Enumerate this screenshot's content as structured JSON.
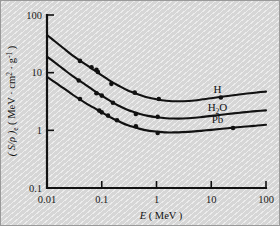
{
  "figure": {
    "background_color": "#d6d6d6",
    "ink_color": "#111111",
    "border_color": "#9a9a9a"
  },
  "axes": {
    "x": {
      "title_symbol": "E",
      "title_units": "( MeV )",
      "tick_labels": [
        "0.01",
        "0.1",
        "1",
        "10",
        "100"
      ],
      "tick_values": [
        0.01,
        0.1,
        1,
        10,
        100
      ],
      "scale": "log",
      "range": [
        0.01,
        100
      ]
    },
    "y": {
      "title_symbol": "( S/ρ )",
      "title_subscript": "e",
      "title_units_open": "( MeV · cm",
      "title_units_sup": "2",
      "title_units_mid": " · g",
      "title_units_sup2": "-1",
      "title_units_close": " )",
      "tick_labels": [
        "100",
        "10",
        "1",
        "0.1"
      ],
      "tick_values": [
        100,
        10,
        1,
        0.1
      ],
      "scale": "log",
      "range": [
        0.1,
        100
      ]
    }
  },
  "chart_data": {
    "type": "line",
    "title": "",
    "xlabel": "E ( MeV )",
    "ylabel": "( S/ρ )e ( MeV · cm2 · g-1 )",
    "xscale": "log",
    "yscale": "log",
    "xlim": [
      0.01,
      100
    ],
    "ylim": [
      0.1,
      100
    ],
    "grid": false,
    "legend": "inline-curve-labels",
    "series": [
      {
        "name": "H",
        "label": "H",
        "label_x": 13.0,
        "label_y": 4.4,
        "x": [
          0.01,
          0.015,
          0.02,
          0.03,
          0.05,
          0.07,
          0.1,
          0.15,
          0.2,
          0.3,
          0.5,
          0.7,
          1.0,
          1.5,
          2.0,
          3.0,
          5.0,
          7.0,
          10.0,
          20.0,
          30.0,
          50.0,
          70.0,
          100.0
        ],
        "y": [
          45.0,
          33.0,
          26.5,
          19.5,
          14.0,
          11.3,
          9.0,
          7.0,
          6.0,
          4.9,
          4.1,
          3.7,
          3.45,
          3.25,
          3.2,
          3.2,
          3.3,
          3.45,
          3.6,
          3.95,
          4.15,
          4.4,
          4.55,
          4.7
        ],
        "markers_x": [
          0.04,
          0.065,
          0.08,
          0.085,
          0.15,
          0.4,
          1.1,
          15.0
        ],
        "markers_y": [
          16.0,
          12.4,
          11.2,
          10.3,
          6.4,
          4.5,
          3.5,
          3.7
        ]
      },
      {
        "name": "H2O",
        "label": "H₂O",
        "label_x": 13.0,
        "label_y": 2.15,
        "x": [
          0.01,
          0.015,
          0.02,
          0.03,
          0.05,
          0.07,
          0.1,
          0.15,
          0.2,
          0.3,
          0.5,
          0.7,
          1.0,
          1.5,
          2.0,
          3.0,
          5.0,
          7.0,
          10.0,
          20.0,
          30.0,
          50.0,
          70.0,
          100.0
        ],
        "y": [
          19.0,
          14.2,
          11.5,
          8.6,
          6.2,
          5.0,
          4.0,
          3.15,
          2.7,
          2.25,
          1.92,
          1.78,
          1.69,
          1.62,
          1.6,
          1.6,
          1.65,
          1.71,
          1.78,
          1.92,
          2.0,
          2.1,
          2.16,
          2.22
        ]
      },
      {
        "name": "Pb",
        "label": "Pb",
        "label_x": 13.0,
        "label_y": 1.32,
        "x": [
          0.01,
          0.015,
          0.02,
          0.03,
          0.05,
          0.07,
          0.1,
          0.15,
          0.2,
          0.3,
          0.5,
          0.7,
          1.0,
          1.5,
          2.0,
          3.0,
          5.0,
          7.0,
          10.0,
          20.0,
          30.0,
          50.0,
          70.0,
          100.0
        ],
        "y": [
          8.5,
          6.5,
          5.4,
          4.1,
          3.0,
          2.5,
          2.05,
          1.65,
          1.45,
          1.22,
          1.06,
          0.99,
          0.95,
          0.92,
          0.92,
          0.93,
          0.96,
          0.99,
          1.02,
          1.09,
          1.13,
          1.18,
          1.21,
          1.25
        ],
        "markers_x": [
          0.04,
          0.09,
          0.1,
          0.13,
          0.19,
          0.42,
          1.05,
          25.0
        ],
        "markers_y": [
          3.5,
          2.2,
          2.05,
          1.8,
          1.5,
          1.18,
          0.9,
          1.1
        ]
      },
      {
        "name": "H2O-markers",
        "label": "",
        "label_x": 0,
        "label_y": 0,
        "x": [],
        "y": [],
        "markers_x": [
          0.038,
          0.08,
          0.1,
          0.16,
          0.42,
          1.05
        ],
        "markers_y": [
          7.3,
          4.4,
          4.0,
          3.0,
          1.92,
          1.72
        ]
      }
    ]
  }
}
